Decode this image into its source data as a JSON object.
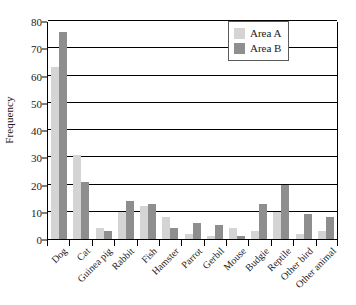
{
  "chart_data": {
    "type": "bar",
    "title": "",
    "xlabel": "",
    "ylabel": "Frequency",
    "ylim": [
      0,
      80
    ],
    "yticks": [
      0,
      10,
      20,
      30,
      40,
      50,
      60,
      70,
      80
    ],
    "grid": true,
    "legend_position": "top-right",
    "categories": [
      "Dog",
      "Cat",
      "Guinea pig",
      "Rabbit",
      "Fish",
      "Hamster",
      "Parrot",
      "Gerbil",
      "Mouse",
      "Budgie",
      "Reptile",
      "Other bird",
      "Other animal"
    ],
    "series": [
      {
        "name": "Area A",
        "color": "#d4d4d4",
        "values": [
          63,
          31,
          4,
          10,
          12,
          8,
          2,
          1,
          4,
          3,
          10,
          2,
          3
        ]
      },
      {
        "name": "Area B",
        "color": "#8e8e8e",
        "values": [
          76,
          21,
          3,
          14,
          13,
          4,
          6,
          5,
          1,
          13,
          20,
          9,
          8
        ]
      }
    ]
  },
  "legend": {
    "items": [
      {
        "label": "Area A"
      },
      {
        "label": "Area B"
      }
    ]
  }
}
